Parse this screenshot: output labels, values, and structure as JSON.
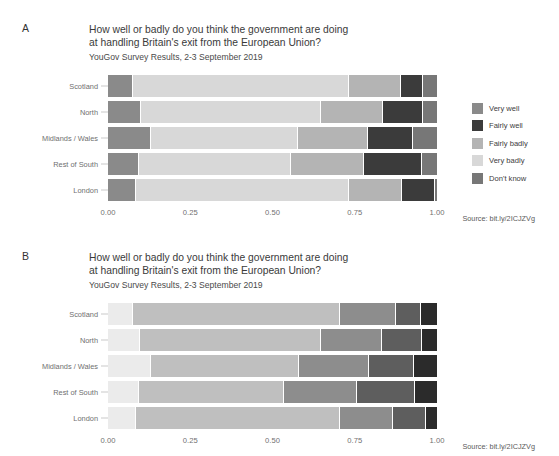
{
  "panels": [
    {
      "letter": "A",
      "title_line1": "How well or badly do you think the government are doing",
      "title_line2": "at handling Britain's exit from the European Union?",
      "subtitle": "YouGov Survey Results, 2-3 September 2019",
      "source": "Source: bit.ly/2ICJZVg"
    },
    {
      "letter": "B",
      "title_line1": "How well or badly do you think the government are doing",
      "title_line2": "at handling Britain's exit from the European Union?",
      "subtitle": "YouGov Survey Results, 2-3 September 2019",
      "source": "Source: bit.ly/2ICJZVg"
    }
  ],
  "legend_a": {
    "items": [
      {
        "label": "Very well",
        "color": "#8a8a8a"
      },
      {
        "label": "Fairly well",
        "color": "#3b3b3b"
      },
      {
        "label": "Fairly badly",
        "color": "#b4b4b4"
      },
      {
        "label": "Very badly",
        "color": "#d8d8d8"
      },
      {
        "label": "Don't know",
        "color": "#777777"
      }
    ]
  },
  "legend_b": {
    "items": [
      {
        "label": "Very well",
        "color": "#2b2b2b"
      },
      {
        "label": "Fairly well",
        "color": "#5e5e5e"
      },
      {
        "label": "Fairly badly",
        "color": "#8d8d8d"
      },
      {
        "label": "Very badly",
        "color": "#bfbfbf"
      },
      {
        "label": "Don't know",
        "color": "#ebebeb"
      }
    ]
  },
  "axis": {
    "ticks": [
      "0.00",
      "0.25",
      "0.50",
      "0.75",
      "1.00"
    ],
    "tick_values": [
      0,
      0.25,
      0.5,
      0.75,
      1
    ],
    "xlim": [
      0,
      1
    ]
  },
  "chart_data": {
    "type": "bar",
    "orientation": "horizontal",
    "stacked": true,
    "normalized": true,
    "title": "How well or badly do you think the government are doing at handling Britain's exit from the European Union?",
    "subtitle": "YouGov Survey Results, 2-3 September 2019",
    "source": "Source: bit.ly/2ICJZVg",
    "xlabel": "",
    "ylabel": "",
    "xlim": [
      0,
      1
    ],
    "xticks": [
      0,
      0.25,
      0.5,
      0.75,
      1
    ],
    "xticklabels": [
      "0.00",
      "0.25",
      "0.50",
      "0.75",
      "1.00"
    ],
    "grid": false,
    "legend_position": "right",
    "categories": [
      "Scotland",
      "North",
      "Midlands / Wales",
      "Rest of South",
      "London"
    ],
    "response_levels": [
      "Very well",
      "Fairly well",
      "Fairly badly",
      "Very badly",
      "Don't know"
    ],
    "panels": [
      {
        "letter": "A",
        "note": "Unordered/qualitative palette; segment order left-to-right: Very well, Very badly, Fairly badly, Fairly well, Don't know",
        "segment_order": [
          "Very well",
          "Very badly",
          "Fairly badly",
          "Fairly well",
          "Don't know"
        ],
        "series": [
          {
            "name": "Very well",
            "values": [
              0.073,
              0.097,
              0.128,
              0.091,
              0.082
            ]
          },
          {
            "name": "Fairly well",
            "values": [
              0.067,
              0.122,
              0.137,
              0.176,
              0.1
            ]
          },
          {
            "name": "Fairly badly",
            "values": [
              0.158,
              0.188,
              0.213,
              0.222,
              0.161
            ]
          },
          {
            "name": "Very badly",
            "values": [
              0.656,
              0.547,
              0.447,
              0.462,
              0.647
            ]
          },
          {
            "name": "Don't know",
            "values": [
              0.046,
              0.046,
              0.076,
              0.049,
              0.009
            ]
          }
        ]
      },
      {
        "letter": "B",
        "note": "Sequential ordered palette; segment order left-to-right: Don't know, Very badly, Fairly badly, Fairly well, Very well",
        "segment_order": [
          "Don't know",
          "Very badly",
          "Fairly badly",
          "Fairly well",
          "Very well"
        ],
        "series": [
          {
            "name": "Don't know",
            "values": [
              0.073,
              0.094,
              0.128,
              0.091,
              0.082
            ]
          },
          {
            "name": "Very badly",
            "values": [
              0.629,
              0.55,
              0.45,
              0.44,
              0.62
            ]
          },
          {
            "name": "Fairly badly",
            "values": [
              0.17,
              0.186,
              0.213,
              0.222,
              0.161
            ]
          },
          {
            "name": "Fairly well",
            "values": [
              0.076,
              0.122,
              0.137,
              0.176,
              0.1
            ]
          },
          {
            "name": "Very well",
            "values": [
              0.052,
              0.049,
              0.073,
              0.07,
              0.037
            ]
          }
        ]
      }
    ]
  }
}
